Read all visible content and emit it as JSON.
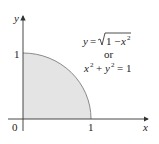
{
  "diagram": {
    "type": "quarter-circle-region",
    "axes": {
      "x_label": "x",
      "y_label": "y",
      "origin_label": "0",
      "x_tick_label": "1",
      "y_tick_label": "1"
    },
    "equation": {
      "line1_lhs": "y = ",
      "line1_radicand": "1 − x",
      "line1_exp": "2",
      "connector": "or",
      "line3_x": "x",
      "line3_x_exp": "2",
      "line3_mid": " + y",
      "line3_y_exp": "2",
      "line3_rhs": " = 1"
    },
    "colors": {
      "fill": "#e4e4e4",
      "curve": "#8a8a8a",
      "axis": "#333333"
    }
  }
}
